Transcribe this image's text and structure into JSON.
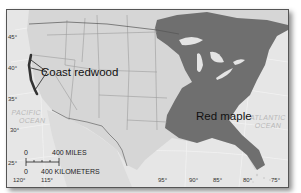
{
  "map": {
    "title": "",
    "colors": {
      "ocean": "#e6e6e6",
      "land": "#d6d6d6",
      "borders": "#9a9a9a",
      "red_maple_range": "#6f6f6f",
      "coast_redwood_range": "#3a3a3a",
      "lakes": "#e8e8e8"
    },
    "species": [
      {
        "name": "Coast redwood",
        "region": "Pacific coast of northern California / southern Oregon"
      },
      {
        "name": "Red maple",
        "region": "Eastern United States"
      }
    ],
    "oceans": [
      {
        "line1": "PACIFIC",
        "line2": "OCEAN"
      },
      {
        "line1": "ATLANTIC",
        "line2": "OCEAN"
      }
    ],
    "latitudes": [
      "45°",
      "40°",
      "35°",
      "30°",
      "25°"
    ],
    "longitudes": [
      "120°",
      "115°",
      "95°",
      "90°",
      "85°",
      "80°",
      "75°"
    ],
    "scale": {
      "miles_zero": "0",
      "miles_label": "400 MILES",
      "km_zero": "0",
      "km_label": "400 KILOMETERS"
    }
  }
}
